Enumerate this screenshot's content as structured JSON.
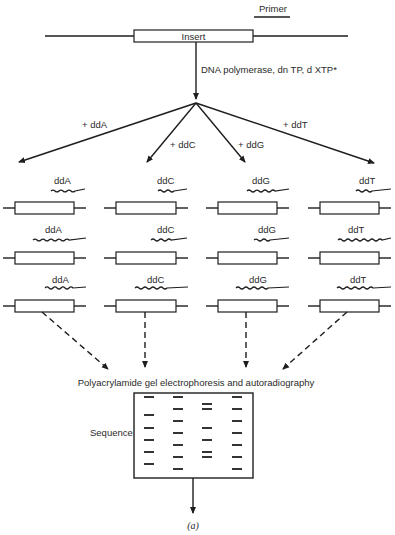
{
  "diagram": {
    "primer_label": "Primer",
    "insert_label": "Insert",
    "reaction_label": "DNA polymerase, dn TP, d XTP*",
    "branches": [
      {
        "label": "+ ddA",
        "terminator": "ddA"
      },
      {
        "label": "+ ddC",
        "terminator": "ddC"
      },
      {
        "label": "+ ddG",
        "terminator": "ddG"
      },
      {
        "label": "+ ddT",
        "terminator": "ddT"
      }
    ],
    "fragment_labels": {
      "col0": [
        "ddA",
        "ddA",
        "ddA"
      ],
      "col1": [
        "ddC",
        "ddC",
        "ddC"
      ],
      "col2": [
        "ddG",
        "ddG",
        "ddG"
      ],
      "col3": [
        "ddT",
        "ddT",
        "ddT"
      ]
    },
    "gel_label": "Polyacrylamide gel electrophoresis and autoradiography",
    "sequence_label": "Sequence",
    "panel_label": "(a)",
    "gel_lanes": [
      "A",
      "C",
      "G",
      "T"
    ],
    "gel_bands": {
      "A": [
        397,
        415,
        428,
        440,
        452,
        464
      ],
      "C": [
        397,
        409,
        421,
        433,
        445,
        457,
        469
      ],
      "G": [
        404,
        409,
        428,
        440,
        452,
        457
      ],
      "T": [
        397,
        409,
        421,
        433,
        445,
        457,
        469
      ]
    }
  }
}
